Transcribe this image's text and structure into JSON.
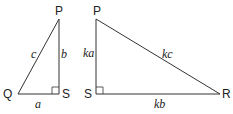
{
  "diagram": {
    "triangle_1": {
      "vertices": {
        "top": "P",
        "left": "Q",
        "right_angle": "S"
      },
      "sides": {
        "hypotenuse": "c",
        "vertical": "b",
        "base": "a"
      }
    },
    "triangle_2": {
      "vertices": {
        "top": "P",
        "right_angle": "S",
        "right": "R"
      },
      "sides": {
        "vertical": "ka",
        "hypotenuse": "kc",
        "base": "kb"
      }
    },
    "colors": {
      "stroke": "#333333",
      "text": "#222222"
    }
  }
}
